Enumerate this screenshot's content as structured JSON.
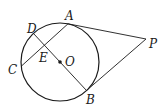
{
  "diagram": {
    "type": "geometry",
    "colors": {
      "stroke": "#1a1a1a",
      "background": "#ffffff"
    },
    "circle": {
      "label": "O",
      "cx": 60,
      "cy": 62,
      "r": 39
    },
    "points": {
      "A": {
        "label": "A",
        "x": 68,
        "y": 23.8
      },
      "B": {
        "label": "B",
        "x": 86.5,
        "y": 90.5
      },
      "C": {
        "label": "C",
        "x": 21.5,
        "y": 66
      },
      "D": {
        "label": "D",
        "x": 33.5,
        "y": 33.5
      },
      "E": {
        "label": "E",
        "x": 44.5,
        "y": 45.4
      },
      "O": {
        "label": "O",
        "x": 60,
        "y": 62
      },
      "P": {
        "label": "P",
        "x": 146,
        "y": 39
      }
    },
    "segments": [
      {
        "name": "PA",
        "from": "P",
        "to": "A"
      },
      {
        "name": "PB",
        "from": "P",
        "to": "B"
      },
      {
        "name": "DB",
        "from": "D",
        "to": "B"
      },
      {
        "name": "AC",
        "from": "A",
        "to": "C"
      }
    ],
    "labels": {
      "A": "A",
      "B": "B",
      "C": "C",
      "D": "D",
      "E": "E",
      "O": "O",
      "P": "P"
    }
  }
}
